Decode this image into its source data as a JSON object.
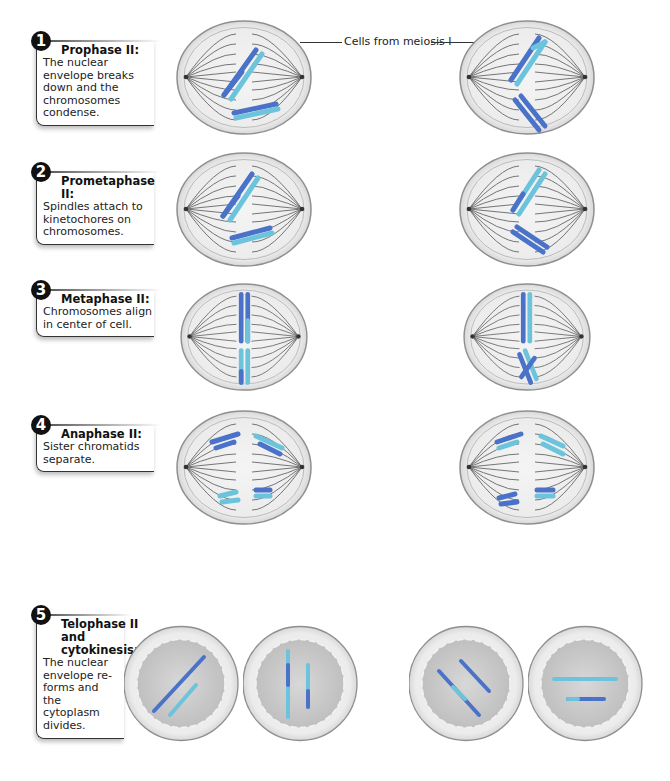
{
  "callout": {
    "label": "Cells from meiosis I"
  },
  "steps": [
    {
      "number": "1",
      "title": "Prophase II:",
      "description": "The nuclear envelope breaks down and the chromosomes condense."
    },
    {
      "number": "2",
      "title": "Prometaphase II:",
      "description": "Spindles attach to kinetochores on chromosomes."
    },
    {
      "number": "3",
      "title": "Metaphase II:",
      "description": "Chromosomes align in center of cell."
    },
    {
      "number": "4",
      "title": "Anaphase II:",
      "description": "Sister chromatids separate."
    },
    {
      "number": "5",
      "title": "Telophase II and cytokinesis:",
      "description": "The nuclear envelope re-forms and the cytoplasm divides."
    }
  ],
  "colors": {
    "dark_chromatid": "#4a72c8",
    "light_chromatid": "#6cc3dc",
    "cell_fill": "#e6e6e6",
    "cell_border": "#9a9a9a",
    "spindle": "#666666",
    "nucleus_fill": "#cfcfcf"
  }
}
